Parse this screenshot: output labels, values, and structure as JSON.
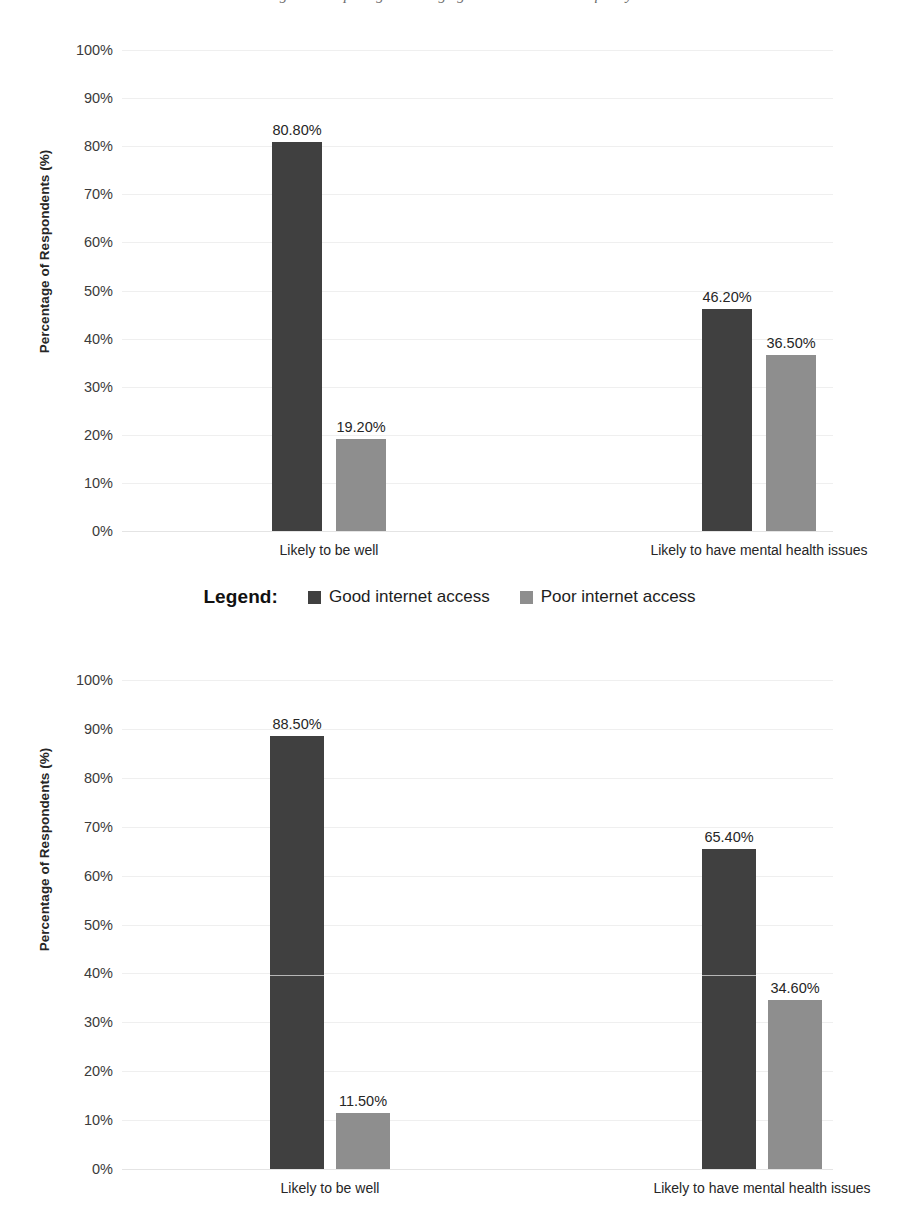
{
  "top_caption": "Figure: Comparing wellbeing against internet access quality",
  "legend": {
    "title": "Legend:",
    "entries": [
      {
        "label": "Good internet access",
        "color": "#404040",
        "swatch": "dark"
      },
      {
        "label": "Poor internet access",
        "color": "#8e8e8e",
        "swatch": "light"
      }
    ]
  },
  "axis": {
    "ylabel": "Percentage of Respondents (%)",
    "yticks": [
      "100%",
      "90%",
      "80%",
      "70%",
      "60%",
      "50%",
      "40%",
      "30%",
      "20%",
      "10%",
      "0%"
    ],
    "ytick_values": [
      100,
      90,
      80,
      70,
      60,
      50,
      40,
      30,
      20,
      10,
      0
    ]
  },
  "chart_data": [
    {
      "type": "bar",
      "id": "chart-one",
      "title": "",
      "xlabel": "",
      "ylabel": "Percentage of Respondents (%)",
      "ylim": [
        0,
        100
      ],
      "grid": true,
      "legend_position": "below",
      "categories": [
        "Likely to be well",
        "Likely to have mental health issues"
      ],
      "series": [
        {
          "name": "Good internet access",
          "color": "#404040",
          "values": [
            80.8,
            36.5
          ],
          "labels": [
            "80.80%",
            "46.20%"
          ]
        },
        {
          "name": "Poor internet access",
          "color": "#8e8e8e",
          "values": [
            19.2,
            36.5
          ],
          "labels": [
            "19.20%",
            "36.50%"
          ]
        }
      ],
      "points": [
        {
          "category": "Likely to be well",
          "series": "Good internet access",
          "value": 80.8,
          "label": "80.80%"
        },
        {
          "category": "Likely to be well",
          "series": "Poor internet access",
          "value": 19.2,
          "label": "19.20%"
        },
        {
          "category": "Likely to have mental health issues",
          "series": "Good internet access",
          "value": 46.2,
          "label": "46.20%"
        },
        {
          "category": "Likely to have mental health issues",
          "series": "Poor internet access",
          "value": 36.5,
          "label": "36.50%"
        }
      ]
    },
    {
      "type": "bar",
      "id": "chart-two",
      "title": "",
      "xlabel": "",
      "ylabel": "Percentage of Respondents (%)",
      "ylim": [
        0,
        100
      ],
      "grid": true,
      "legend_position": "above",
      "categories": [
        "Likely to be well",
        "Likely to have mental health issues"
      ],
      "series": [
        {
          "name": "Good internet access",
          "color": "#404040",
          "values": [
            88.5,
            65.4
          ],
          "labels": [
            "88.50%",
            "65.40%"
          ]
        },
        {
          "name": "Poor internet access",
          "color": "#8e8e8e",
          "values": [
            11.5,
            34.6
          ],
          "labels": [
            "11.50%",
            "34.60%"
          ]
        }
      ],
      "points": [
        {
          "category": "Likely to be well",
          "series": "Good internet access",
          "value": 88.5,
          "label": "88.50%"
        },
        {
          "category": "Likely to be well",
          "series": "Poor internet access",
          "value": 11.5,
          "label": "11.50%"
        },
        {
          "category": "Likely to have mental health issues",
          "series": "Good internet access",
          "value": 65.4,
          "label": "65.40%"
        },
        {
          "category": "Likely to have mental health issues",
          "series": "Poor internet access",
          "value": 34.6,
          "label": "34.60%"
        }
      ]
    }
  ]
}
